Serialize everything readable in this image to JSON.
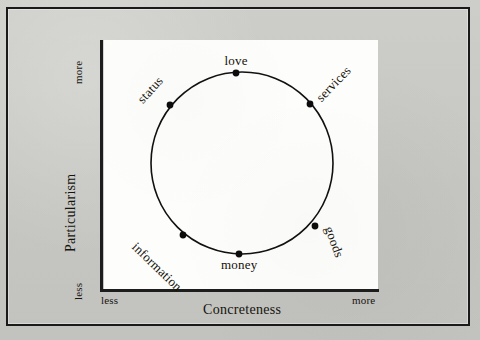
{
  "figure": {
    "background_color": "#c9c9c6",
    "panel_color": "#fdfdfc",
    "axis_color": "#1d1d1d",
    "border_color": "#1a1a1a"
  },
  "axes": {
    "x": {
      "title": "Concreteness",
      "low_label": "less",
      "high_label": "more"
    },
    "y": {
      "title": "Particularism",
      "low_label": "less",
      "high_label": "more"
    }
  },
  "chart_data": {
    "type": "scatter",
    "title": "",
    "xlabel": "Concreteness",
    "ylabel": "Particularism",
    "xlim": [
      0,
      1
    ],
    "ylim": [
      0,
      1
    ],
    "grid": false,
    "legend": "none",
    "annotation": "Six resource classes arranged on a circumplex in the Concreteness x Particularism plane",
    "shape": {
      "kind": "circle",
      "center_x": 242,
      "center_y": 163,
      "radius": 91,
      "stroke": "#111111",
      "stroke_width": 1.6
    },
    "categories": [
      "love",
      "services",
      "goods",
      "money",
      "information",
      "status"
    ],
    "points": [
      {
        "label": "love",
        "angle_deg": 94,
        "x": 236,
        "y": 73,
        "label_rotation": 0,
        "label_position": "above"
      },
      {
        "label": "services",
        "angle_deg": 42,
        "x": 310,
        "y": 104,
        "label_rotation": -46,
        "label_position": "outside"
      },
      {
        "label": "goods",
        "angle_deg": -38,
        "x": 315,
        "y": 226,
        "label_rotation": 70,
        "label_position": "outside"
      },
      {
        "label": "money",
        "angle_deg": -88,
        "x": 239,
        "y": 254,
        "label_rotation": 0,
        "label_position": "below"
      },
      {
        "label": "information",
        "angle_deg": -139,
        "x": 183,
        "y": 235,
        "label_rotation": 44,
        "label_position": "outside"
      },
      {
        "label": "status",
        "angle_deg": 142,
        "x": 170,
        "y": 105,
        "label_rotation": -48,
        "label_position": "outside"
      }
    ]
  }
}
